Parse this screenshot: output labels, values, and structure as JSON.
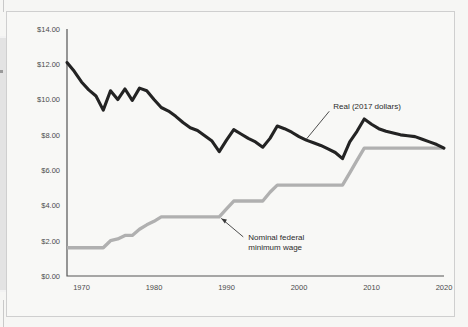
{
  "chart_data": {
    "type": "line",
    "title": "",
    "subtitle": "",
    "xlabel": "",
    "ylabel": "",
    "xlim": [
      1968,
      2020
    ],
    "ylim": [
      0,
      14
    ],
    "grid": false,
    "legend_position": "inline-annotation",
    "y_ticks": [
      "$0.00",
      "$2.00",
      "$4.00",
      "$6.00",
      "$8.00",
      "$10.00",
      "$12.00",
      "$14.00"
    ],
    "y_tick_values": [
      0,
      2,
      4,
      6,
      8,
      10,
      12,
      14
    ],
    "x_ticks": [
      "1970",
      "1980",
      "1990",
      "2000",
      "2010",
      "2020"
    ],
    "x_tick_values": [
      1970,
      1980,
      1990,
      2000,
      2010,
      2020
    ],
    "annotations": [
      {
        "name": "real-series-annotation",
        "text": "Real (2017 dollars)",
        "lines": [
          "Real (2017 dollars)"
        ],
        "points_to_year": 2001,
        "points_to_value": 7.75
      },
      {
        "name": "nominal-series-annotation",
        "text": "Nominal federal minimum wage",
        "lines": [
          "Nominal federal",
          "minimum wage"
        ],
        "points_to_year": 1989,
        "points_to_value": 3.35
      }
    ],
    "series": [
      {
        "name": "Real (2017 dollars)",
        "color": "#232323",
        "x": [
          1968,
          1969,
          1970,
          1971,
          1972,
          1973,
          1974,
          1975,
          1976,
          1977,
          1978,
          1979,
          1980,
          1981,
          1982,
          1983,
          1984,
          1985,
          1986,
          1987,
          1988,
          1989,
          1990,
          1991,
          1992,
          1993,
          1994,
          1995,
          1996,
          1997,
          1998,
          1999,
          2000,
          2001,
          2002,
          2003,
          2004,
          2005,
          2006,
          2007,
          2008,
          2009,
          2010,
          2011,
          2012,
          2013,
          2014,
          2015,
          2016,
          2017,
          2018,
          2019,
          2020
        ],
        "values": [
          12.1,
          11.6,
          11.0,
          10.55,
          10.2,
          9.4,
          10.5,
          10.0,
          10.6,
          9.95,
          10.65,
          10.5,
          10.0,
          9.55,
          9.35,
          9.05,
          8.7,
          8.4,
          8.25,
          7.95,
          7.65,
          7.05,
          7.7,
          8.3,
          8.05,
          7.8,
          7.6,
          7.3,
          7.8,
          8.5,
          8.35,
          8.15,
          7.9,
          7.7,
          7.55,
          7.4,
          7.2,
          7.0,
          6.65,
          7.6,
          8.2,
          8.9,
          8.6,
          8.35,
          8.2,
          8.1,
          8.0,
          7.95,
          7.9,
          7.75,
          7.6,
          7.45,
          7.25
        ]
      },
      {
        "name": "Nominal federal minimum wage",
        "color": "#b0b0b0",
        "x": [
          1968,
          1969,
          1970,
          1971,
          1972,
          1973,
          1974,
          1975,
          1976,
          1977,
          1978,
          1979,
          1980,
          1981,
          1982,
          1983,
          1984,
          1985,
          1986,
          1987,
          1988,
          1989,
          1990,
          1991,
          1992,
          1993,
          1994,
          1995,
          1996,
          1997,
          1998,
          1999,
          2000,
          2001,
          2002,
          2003,
          2004,
          2005,
          2006,
          2007,
          2008,
          2009,
          2010,
          2011,
          2012,
          2013,
          2014,
          2015,
          2016,
          2017,
          2018,
          2019,
          2020
        ],
        "values": [
          1.6,
          1.6,
          1.6,
          1.6,
          1.6,
          1.6,
          2.0,
          2.1,
          2.3,
          2.3,
          2.65,
          2.9,
          3.1,
          3.35,
          3.35,
          3.35,
          3.35,
          3.35,
          3.35,
          3.35,
          3.35,
          3.35,
          3.8,
          4.25,
          4.25,
          4.25,
          4.25,
          4.25,
          4.75,
          5.15,
          5.15,
          5.15,
          5.15,
          5.15,
          5.15,
          5.15,
          5.15,
          5.15,
          5.15,
          5.85,
          6.55,
          7.25,
          7.25,
          7.25,
          7.25,
          7.25,
          7.25,
          7.25,
          7.25,
          7.25,
          7.25,
          7.25,
          7.25
        ]
      }
    ]
  },
  "colors": {
    "background": "#f6f6f4",
    "panel": "#f8f8f6",
    "frame_border": "#cfcfcf",
    "axis": "#555555",
    "real_line": "#232323",
    "nominal_line": "#b0b0b0",
    "tick_text": "#4b4b4b",
    "annotation_text": "#2b2b2b"
  }
}
